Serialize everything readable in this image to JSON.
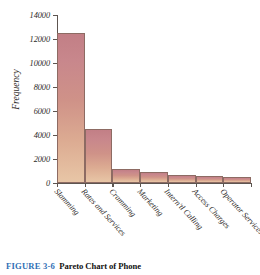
{
  "figure": {
    "caption_label": "FIGURE 3-6",
    "caption_text": "Pareto Chart of Phone",
    "accent_color": "#2f6fb5"
  },
  "chart_data": {
    "type": "bar",
    "title": "",
    "xlabel": "",
    "ylabel": "Frequency",
    "categories": [
      "Slamming",
      "Rates and Services",
      "Cramming",
      "Marketing",
      "Intern'tl Calling",
      "Access Charges",
      "Operator Services"
    ],
    "values": [
      12500,
      4500,
      1150,
      950,
      700,
      600,
      500
    ],
    "ylim": [
      0,
      14000
    ],
    "yticks": [
      0,
      2000,
      4000,
      6000,
      8000,
      10000,
      12000,
      14000
    ],
    "ytick_labels": [
      "0",
      "2000",
      "4000",
      "6000",
      "8000",
      "10000",
      "12000",
      "14000"
    ],
    "grid": false,
    "legend": null,
    "bar_color_top": "#c27f86",
    "bar_color_bottom": "#e8c6a6",
    "axis_color": "#5d5550"
  }
}
